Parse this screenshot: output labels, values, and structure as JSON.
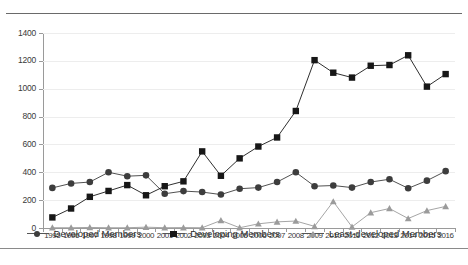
{
  "chart_data": {
    "type": "line",
    "title": "",
    "subtitle": "",
    "xlabel": "",
    "ylabel": "",
    "ylim": [
      0,
      1400
    ],
    "ytick_step": 200,
    "yticks": [
      0,
      200,
      400,
      600,
      800,
      1000,
      1200,
      1400
    ],
    "grid": true,
    "legend_position": "bottom",
    "categories": [
      "1995",
      "1996",
      "1997",
      "1998",
      "1999",
      "2000",
      "2001",
      "2002",
      "2003",
      "2004",
      "2005",
      "2006",
      "2007",
      "2008",
      "2009",
      "2010",
      "2011",
      "2012",
      "2013",
      "2014",
      "2015",
      "2016"
    ],
    "series": [
      {
        "name": "Developed Members",
        "marker": "circle",
        "color": "#3d3d3d",
        "values": [
          288,
          320,
          330,
          400,
          372,
          378,
          246,
          265,
          258,
          240,
          282,
          290,
          330,
          400,
          300,
          305,
          290,
          330,
          350,
          285,
          340,
          408
        ]
      },
      {
        "name": "Developing Members",
        "marker": "square",
        "color": "#171717",
        "values": [
          76,
          140,
          224,
          266,
          308,
          235,
          300,
          335,
          550,
          375,
          500,
          585,
          650,
          840,
          1205,
          1115,
          1080,
          1165,
          1170,
          1240,
          1015,
          1105
        ]
      },
      {
        "name": "Least-developed Members",
        "marker": "triangle",
        "color": "#9b9b9b",
        "values": [
          2,
          2,
          4,
          2,
          2,
          6,
          2,
          3,
          2,
          54,
          2,
          30,
          44,
          50,
          12,
          190,
          8,
          110,
          140,
          68,
          125,
          155
        ]
      }
    ]
  },
  "legend": {
    "items": [
      {
        "label": "Developed Members",
        "icon": "circle-marker-icon"
      },
      {
        "label": "Developing Members",
        "icon": "square-marker-icon"
      },
      {
        "label": "Least-developed Members",
        "icon": "triangle-marker-icon"
      }
    ]
  },
  "caption": {
    "text": ""
  }
}
